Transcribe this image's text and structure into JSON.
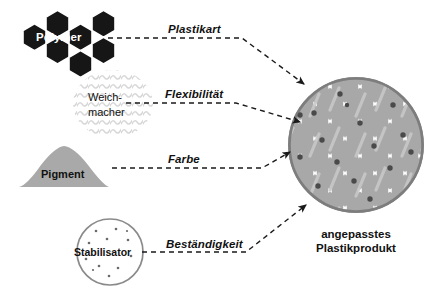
{
  "diagram": {
    "ingredients": [
      {
        "id": "polymer",
        "label": "Polymer",
        "shape": "hexagon-cluster",
        "color": "#161616",
        "label_color": "#ffffff",
        "arrow_label": "Plastikart"
      },
      {
        "id": "weichmacher",
        "label_line1": "Weich-",
        "label_line2": "macher",
        "shape": "squiggle-cluster",
        "color": "#d9d9d9",
        "label_color": "#111111",
        "arrow_label": "Flexibilität"
      },
      {
        "id": "pigment",
        "label": "Pigment",
        "shape": "triangle",
        "color": "#a9a9a9",
        "label_color": "#111111",
        "arrow_label": "Farbe"
      },
      {
        "id": "stabilisator",
        "label": "Stabilisator",
        "shape": "dotted-circle",
        "color": "#ffffff",
        "stroke": "#8a8a8a",
        "label_color": "#111111",
        "arrow_label": "Beständigkeit"
      }
    ],
    "product": {
      "id": "plastikprodukt",
      "caption_line1": "angepasstes",
      "caption_line2": "Plastikprodukt",
      "shape": "honeycomb-circle",
      "fill": "#a8a8a8",
      "ring": "#7d7d7d",
      "cell_gap": "#ffffff",
      "dot_color": "#4a4a4a"
    },
    "arrow_style": {
      "dash": "5,4",
      "color": "#1a1a1a",
      "width": 1.4
    }
  }
}
